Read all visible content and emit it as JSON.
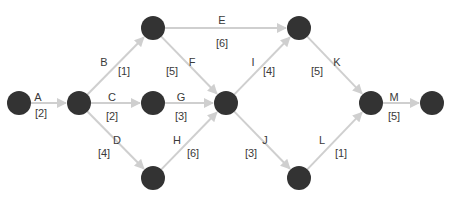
{
  "diagram": {
    "type": "activity-on-arrow network",
    "colors": {
      "node": "#333333",
      "edge": "#cfcfcf",
      "text": "#3a3a3a",
      "background": "#ffffff"
    },
    "nodes": [
      {
        "id": "n1",
        "x": 19,
        "y": 103
      },
      {
        "id": "n2",
        "x": 79,
        "y": 103
      },
      {
        "id": "n3",
        "x": 153,
        "y": 28
      },
      {
        "id": "n4",
        "x": 153,
        "y": 103
      },
      {
        "id": "n5",
        "x": 153,
        "y": 178
      },
      {
        "id": "n6",
        "x": 226,
        "y": 103
      },
      {
        "id": "n7",
        "x": 299,
        "y": 28
      },
      {
        "id": "n8",
        "x": 299,
        "y": 178
      },
      {
        "id": "n9",
        "x": 371,
        "y": 103
      },
      {
        "id": "n10",
        "x": 432,
        "y": 103
      }
    ],
    "activities": [
      {
        "name": "A",
        "duration": "[2]",
        "from": "n1",
        "to": "n2",
        "name_pos": [
          38,
          101
        ],
        "dur_pos": [
          41,
          117
        ]
      },
      {
        "name": "B",
        "duration": "[1]",
        "from": "n2",
        "to": "n3",
        "name_pos": [
          104,
          66
        ],
        "dur_pos": [
          124,
          75
        ]
      },
      {
        "name": "C",
        "duration": "[2]",
        "from": "n2",
        "to": "n4",
        "name_pos": [
          112,
          101
        ],
        "dur_pos": [
          112,
          120
        ]
      },
      {
        "name": "D",
        "duration": "[4]",
        "from": "n2",
        "to": "n5",
        "name_pos": [
          117,
          144
        ],
        "dur_pos": [
          104,
          157
        ]
      },
      {
        "name": "E",
        "duration": "[6]",
        "from": "n3",
        "to": "n7",
        "name_pos": [
          222,
          24
        ],
        "dur_pos": [
          222,
          47
        ]
      },
      {
        "name": "F",
        "duration": "[5]",
        "from": "n3",
        "to": "n6",
        "name_pos": [
          192,
          66
        ],
        "dur_pos": [
          172,
          75
        ]
      },
      {
        "name": "G",
        "duration": "[3]",
        "from": "n4",
        "to": "n6",
        "name_pos": [
          181,
          101
        ],
        "dur_pos": [
          181,
          120
        ]
      },
      {
        "name": "H",
        "duration": "[6]",
        "from": "n5",
        "to": "n6",
        "name_pos": [
          177,
          144
        ],
        "dur_pos": [
          193,
          157
        ]
      },
      {
        "name": "I",
        "duration": "[4]",
        "from": "n6",
        "to": "n7",
        "name_pos": [
          253,
          66
        ],
        "dur_pos": [
          269,
          75
        ]
      },
      {
        "name": "J",
        "duration": "[3]",
        "from": "n6",
        "to": "n8",
        "name_pos": [
          265,
          144
        ],
        "dur_pos": [
          251,
          157
        ]
      },
      {
        "name": "K",
        "duration": "[5]",
        "from": "n7",
        "to": "n9",
        "name_pos": [
          337,
          66
        ],
        "dur_pos": [
          317,
          75
        ]
      },
      {
        "name": "L",
        "duration": "[1]",
        "from": "n8",
        "to": "n9",
        "name_pos": [
          322,
          144
        ],
        "dur_pos": [
          341,
          157
        ]
      },
      {
        "name": "M",
        "duration": "[5]",
        "from": "n9",
        "to": "n10",
        "name_pos": [
          394,
          101
        ],
        "dur_pos": [
          394,
          120
        ]
      }
    ]
  }
}
